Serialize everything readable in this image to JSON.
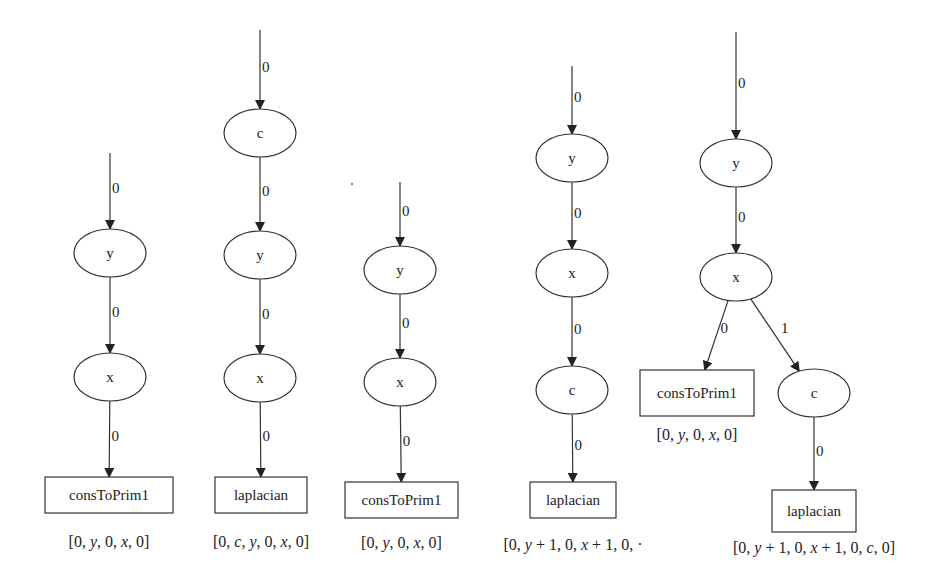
{
  "colors": {
    "stroke": "#333333",
    "text": "#222222",
    "background": "#ffffff"
  },
  "trees": [
    {
      "id": "tree1",
      "start": {
        "x": 110,
        "y": 153
      },
      "nodes": [
        {
          "id": "t1-y",
          "shape": "ellipse",
          "label": "y",
          "cx": 110,
          "cy": 253
        },
        {
          "id": "t1-x",
          "shape": "ellipse",
          "label": "x",
          "cx": 110,
          "cy": 377
        },
        {
          "id": "t1-leaf",
          "shape": "box",
          "label": "consToPrim1",
          "x": 45,
          "y": 477,
          "w": 128,
          "h": 36,
          "annotation": "[0, y, 0, x, 0]",
          "annotation_y": 547
        }
      ],
      "edges": [
        {
          "from": "start",
          "to": "t1-y",
          "label": "0"
        },
        {
          "from": "t1-y",
          "to": "t1-x",
          "label": "0"
        },
        {
          "from": "t1-x",
          "to": "t1-leaf",
          "label": "0"
        }
      ]
    },
    {
      "id": "tree2",
      "start": {
        "x": 260,
        "y": 30
      },
      "nodes": [
        {
          "id": "t2-c",
          "shape": "ellipse",
          "label": "c",
          "cx": 260,
          "cy": 133
        },
        {
          "id": "t2-y",
          "shape": "ellipse",
          "label": "y",
          "cx": 260,
          "cy": 255
        },
        {
          "id": "t2-x",
          "shape": "ellipse",
          "label": "x",
          "cx": 260,
          "cy": 378
        },
        {
          "id": "t2-leaf",
          "shape": "box",
          "label": "laplacian",
          "x": 215,
          "y": 477,
          "w": 92,
          "h": 36,
          "annotation": "[0, c, y, 0, x, 0]",
          "annotation_y": 547
        }
      ],
      "edges": [
        {
          "from": "start",
          "to": "t2-c",
          "label": "0"
        },
        {
          "from": "t2-c",
          "to": "t2-y",
          "label": "0"
        },
        {
          "from": "t2-y",
          "to": "t2-x",
          "label": "0"
        },
        {
          "from": "t2-x",
          "to": "t2-leaf",
          "label": "0"
        }
      ]
    },
    {
      "id": "tree3",
      "start": {
        "x": 400,
        "y": 182
      },
      "nodes": [
        {
          "id": "t3-y",
          "shape": "ellipse",
          "label": "y",
          "cx": 400,
          "cy": 270
        },
        {
          "id": "t3-x",
          "shape": "ellipse",
          "label": "x",
          "cx": 400,
          "cy": 382
        },
        {
          "id": "t3-leaf",
          "shape": "box",
          "label": "consToPrim1",
          "x": 345,
          "y": 482,
          "w": 113,
          "h": 36,
          "annotation": "[0, y, 0, x, 0]",
          "annotation_y": 548
        }
      ],
      "edges": [
        {
          "from": "start",
          "to": "t3-y",
          "label": "0"
        },
        {
          "from": "t3-y",
          "to": "t3-x",
          "label": "0"
        },
        {
          "from": "t3-x",
          "to": "t3-leaf",
          "label": "0"
        }
      ]
    },
    {
      "id": "tree4",
      "start": {
        "x": 572,
        "y": 66
      },
      "nodes": [
        {
          "id": "t4-y",
          "shape": "ellipse",
          "label": "y",
          "cx": 572,
          "cy": 158
        },
        {
          "id": "t4-x",
          "shape": "ellipse",
          "label": "x",
          "cx": 572,
          "cy": 273
        },
        {
          "id": "t4-c",
          "shape": "ellipse",
          "label": "c",
          "cx": 572,
          "cy": 390
        },
        {
          "id": "t4-leaf",
          "shape": "box",
          "label": "laplacian",
          "x": 530,
          "y": 482,
          "w": 86,
          "h": 36,
          "annotation": "[0, y + 1, 0, x + 1, 0, ·",
          "annotation_y": 550
        }
      ],
      "edges": [
        {
          "from": "start",
          "to": "t4-y",
          "label": "0"
        },
        {
          "from": "t4-y",
          "to": "t4-x",
          "label": "0"
        },
        {
          "from": "t4-x",
          "to": "t4-c",
          "label": "0"
        },
        {
          "from": "t4-c",
          "to": "t4-leaf",
          "label": "0"
        }
      ]
    },
    {
      "id": "tree5",
      "start": {
        "x": 736,
        "y": 32
      },
      "nodes": [
        {
          "id": "t5-y",
          "shape": "ellipse",
          "label": "y",
          "cx": 736,
          "cy": 163
        },
        {
          "id": "t5-x",
          "shape": "ellipse",
          "label": "x",
          "cx": 736,
          "cy": 277
        },
        {
          "id": "t5-leaf0",
          "shape": "box",
          "label": "consToPrim1",
          "x": 640,
          "y": 370,
          "w": 114,
          "h": 46,
          "annotation": "[0, y, 0, x, 0]",
          "annotation_y": 440
        },
        {
          "id": "t5-c",
          "shape": "ellipse",
          "label": "c",
          "cx": 814,
          "cy": 393
        },
        {
          "id": "t5-leaf1",
          "shape": "box",
          "label": "laplacian",
          "x": 772,
          "y": 490,
          "w": 84,
          "h": 42,
          "annotation": "[0, y + 1, 0, x + 1, 0, c, 0]",
          "annotation_y": 553
        }
      ],
      "edges": [
        {
          "from": "start",
          "to": "t5-y",
          "label": "0"
        },
        {
          "from": "t5-y",
          "to": "t5-x",
          "label": "0"
        },
        {
          "from": "t5-x",
          "to": "t5-leaf0",
          "label": "0"
        },
        {
          "from": "t5-x",
          "to": "t5-c",
          "label": "1"
        },
        {
          "from": "t5-c",
          "to": "t5-leaf1",
          "label": "0"
        }
      ]
    }
  ],
  "stray_marks": [
    {
      "x": 352,
      "y": 184
    }
  ]
}
